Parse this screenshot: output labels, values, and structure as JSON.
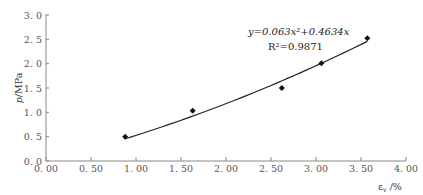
{
  "chart_data": {
    "type": "scatter",
    "title": "",
    "xlabel": "ε_v /%",
    "ylabel": "p/MPa",
    "xlim": [
      0,
      4
    ],
    "ylim": [
      0,
      3
    ],
    "x_ticks": [
      "0.00",
      "0.50",
      "1.00",
      "1.50",
      "2.00",
      "2.50",
      "3.00",
      "3.50",
      "4.00"
    ],
    "y_ticks": [
      "0.0",
      "0.5",
      "1.0",
      "1.5",
      "2.0",
      "2.5",
      "3.0"
    ],
    "grid": false,
    "legend": null,
    "series": [
      {
        "name": "measured",
        "marker": "diamond",
        "x": [
          0.88,
          1.63,
          2.62,
          3.06,
          3.57
        ],
        "y": [
          0.5,
          1.03,
          1.5,
          2.01,
          2.52
        ]
      },
      {
        "name": "fit",
        "type": "line",
        "equation": "y = 0.063x^2 + 0.4634x",
        "coefficients": {
          "a": 0.063,
          "b": 0.4634
        },
        "x_range": [
          0.88,
          3.57
        ]
      }
    ],
    "annotations": [
      {
        "text": "y=0.063x²+0.4634x",
        "position": "upper-right"
      },
      {
        "text": "R²=0.9871",
        "position": "upper-right"
      }
    ]
  },
  "labels": {
    "ylabel_p": "p",
    "ylabel_unit": "/MPa",
    "xlabel_eps": "ε",
    "xlabel_sub": "v",
    "xlabel_unit": " /%",
    "eq_line1": "y=0.063x²+0.4634x",
    "eq_line2": "R²=0.9871"
  }
}
